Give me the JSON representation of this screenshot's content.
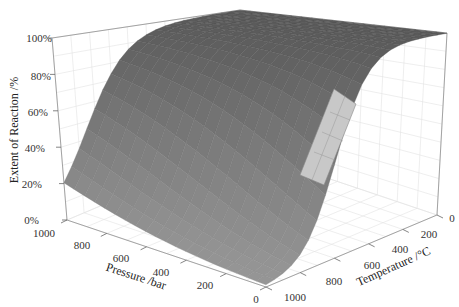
{
  "chart_data": {
    "type": "surface3d",
    "title": "",
    "xlabel": "Pressure /bar",
    "ylabel": "Temperature /°C",
    "zlabel": "Extent of Reaction /%",
    "x_ticks": [
      "0",
      "200",
      "400",
      "600",
      "800",
      "1000"
    ],
    "y_ticks": [
      "0",
      "200",
      "400",
      "600",
      "800",
      "1000"
    ],
    "z_ticks": [
      "0%",
      "20%",
      "40%",
      "60%",
      "80%",
      "100%"
    ],
    "xlim": [
      0,
      1000
    ],
    "ylim": [
      0,
      1000
    ],
    "zlim": [
      0,
      100
    ],
    "grid": true,
    "surface_color": "#6e6e6e",
    "highlight_color": "#c8c8c8",
    "samples": [
      {
        "pressure": 0,
        "temperature": 0,
        "extent": 100
      },
      {
        "pressure": 1000,
        "temperature": 0,
        "extent": 100
      },
      {
        "pressure": 0,
        "temperature": 400,
        "extent": 95
      },
      {
        "pressure": 0,
        "temperature": 600,
        "extent": 40
      },
      {
        "pressure": 0,
        "temperature": 800,
        "extent": 5
      },
      {
        "pressure": 0,
        "temperature": 1000,
        "extent": 0
      },
      {
        "pressure": 1000,
        "temperature": 400,
        "extent": 99
      },
      {
        "pressure": 1000,
        "temperature": 600,
        "extent": 85
      },
      {
        "pressure": 1000,
        "temperature": 800,
        "extent": 50
      },
      {
        "pressure": 1000,
        "temperature": 1000,
        "extent": 20
      }
    ],
    "highlight_region": {
      "pressure": [
        200,
        400
      ],
      "temperature": [
        450,
        700
      ]
    }
  }
}
